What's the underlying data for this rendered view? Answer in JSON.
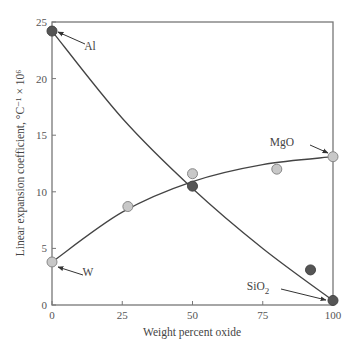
{
  "chart_data": {
    "type": "scatter",
    "title": "",
    "xlabel": "Weight percent oxide",
    "ylabel": "Linear expansion coefficient, °C⁻¹ × 10⁶",
    "xlim": [
      0,
      100
    ],
    "ylim": [
      0,
      25
    ],
    "xticks": [
      "0",
      "25",
      "50",
      "75",
      "100"
    ],
    "yticks": [
      "0",
      "5",
      "10",
      "15",
      "20",
      "25"
    ],
    "grid": false,
    "series": [
      {
        "name": "Al–SiO2 (dark points)",
        "marker": "dark-circle",
        "color": "#555555",
        "points": [
          [
            0,
            24.2
          ],
          [
            50,
            10.5
          ],
          [
            92,
            3.1
          ],
          [
            100,
            0.4
          ]
        ]
      },
      {
        "name": "W–MgO (light points)",
        "marker": "light-circle",
        "color": "#c8c8c8",
        "points": [
          [
            0,
            3.8
          ],
          [
            27,
            8.7
          ],
          [
            50,
            11.6
          ],
          [
            80,
            12.0
          ],
          [
            100,
            13.1
          ]
        ]
      }
    ],
    "curves": [
      {
        "name": "Al–SiO2 fit",
        "points": [
          [
            0,
            24.2
          ],
          [
            25,
            16.5
          ],
          [
            50,
            10.3
          ],
          [
            75,
            5.0
          ],
          [
            100,
            0.4
          ]
        ]
      },
      {
        "name": "W–MgO fit",
        "points": [
          [
            0,
            3.8
          ],
          [
            25,
            8.2
          ],
          [
            50,
            10.9
          ],
          [
            75,
            12.4
          ],
          [
            100,
            13.1
          ]
        ]
      }
    ],
    "annotations": [
      {
        "text": "Al",
        "target": [
          0,
          24.2
        ]
      },
      {
        "text": "W",
        "target": [
          0,
          3.8
        ]
      },
      {
        "text": "MgO",
        "target": [
          100,
          13.1
        ]
      },
      {
        "text": "SiO",
        "subscript": "2",
        "target": [
          100,
          0.4
        ]
      }
    ]
  }
}
